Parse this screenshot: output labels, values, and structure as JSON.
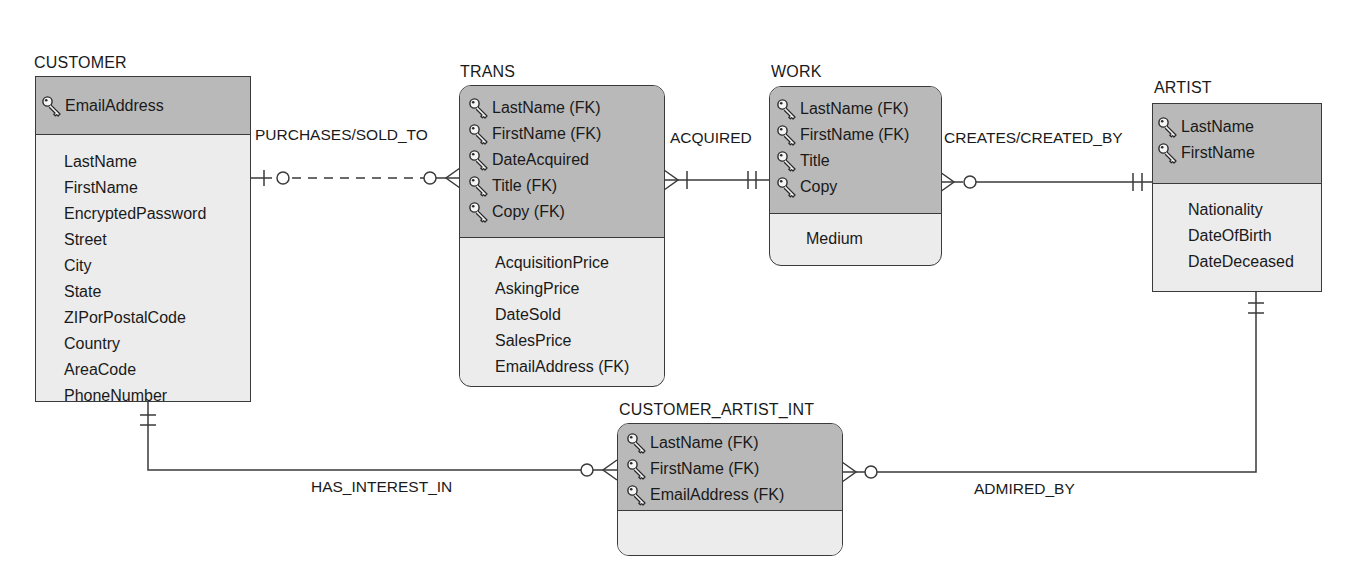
{
  "diagram": {
    "type": "entity-relationship",
    "notation": "IE crow's foot"
  },
  "entities": {
    "customer": {
      "name": "CUSTOMER",
      "primary_keys": [
        "EmailAddress"
      ],
      "attributes": [
        "LastName",
        "FirstName",
        "EncryptedPassword",
        "Street",
        "City",
        "State",
        "ZIPorPostalCode",
        "Country",
        "AreaCode",
        "PhoneNumber"
      ]
    },
    "trans": {
      "name": "TRANS",
      "primary_keys": [
        "LastName (FK)",
        "FirstName (FK)",
        "DateAcquired",
        "Title (FK)",
        "Copy (FK)"
      ],
      "attributes": [
        "AcquisitionPrice",
        "AskingPrice",
        "DateSold",
        "SalesPrice",
        "EmailAddress (FK)"
      ]
    },
    "work": {
      "name": "WORK",
      "primary_keys": [
        "LastName (FK)",
        "FirstName (FK)",
        "Title",
        "Copy"
      ],
      "attributes": [
        "Medium"
      ]
    },
    "artist": {
      "name": "ARTIST",
      "primary_keys": [
        "LastName",
        "FirstName"
      ],
      "attributes": [
        "Nationality",
        "DateOfBirth",
        "DateDeceased"
      ]
    },
    "customer_artist_int": {
      "name": "CUSTOMER_ARTIST_INT",
      "primary_keys": [
        "LastName (FK)",
        "FirstName (FK)",
        "EmailAddress (FK)"
      ],
      "attributes": []
    }
  },
  "relationships": [
    {
      "label": "PURCHASES/SOLD_TO",
      "from": "CUSTOMER",
      "to": "TRANS",
      "from_cardinality": "zero-or-one",
      "to_cardinality": "zero-or-many",
      "identifying": false
    },
    {
      "label": "ACQUIRED",
      "from": "WORK",
      "to": "TRANS",
      "from_cardinality": "exactly-one",
      "to_cardinality": "one-or-many",
      "identifying": true
    },
    {
      "label": "CREATES/CREATED_BY",
      "from": "ARTIST",
      "to": "WORK",
      "from_cardinality": "exactly-one",
      "to_cardinality": "zero-or-many",
      "identifying": true
    },
    {
      "label": "HAS_INTEREST_IN",
      "from": "CUSTOMER",
      "to": "CUSTOMER_ARTIST_INT",
      "from_cardinality": "exactly-one",
      "to_cardinality": "zero-or-many",
      "identifying": true
    },
    {
      "label": "ADMIRED_BY",
      "from": "ARTIST",
      "to": "CUSTOMER_ARTIST_INT",
      "from_cardinality": "exactly-one",
      "to_cardinality": "zero-or-many",
      "identifying": true
    }
  ],
  "icons": {
    "key": "key-icon"
  },
  "colors": {
    "key_section": "#b9b9b9",
    "attribute_section": "#ececec",
    "line": "#3a3a3a",
    "text": "#1a1a1a"
  }
}
